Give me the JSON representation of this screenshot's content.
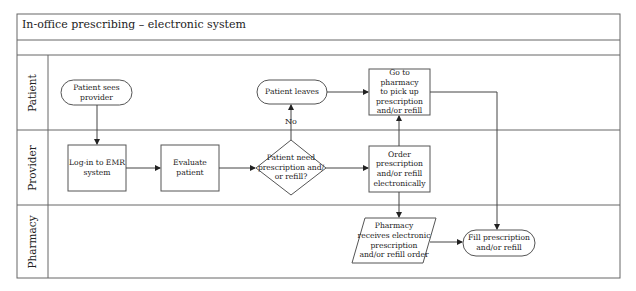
{
  "title": "In-office prescribing – electronic system",
  "lanes": [
    {
      "id": "patient",
      "label": "Patient"
    },
    {
      "id": "provider",
      "label": "Provider"
    },
    {
      "id": "pharmacy",
      "label": "Pharmacy"
    }
  ],
  "nodes": {
    "patient_sees_provider": {
      "shape": "terminator",
      "lane": "patient",
      "text": "Patient sees\nprovider"
    },
    "login_emr": {
      "shape": "process",
      "lane": "provider",
      "text": "Log-in to EMR\nsystem"
    },
    "evaluate_patient": {
      "shape": "process",
      "lane": "provider",
      "text": "Evaluate\npatient"
    },
    "decision_need": {
      "shape": "decision",
      "lane": "provider",
      "text": "Patient need\nprescription and/\nor refill?"
    },
    "patient_leaves": {
      "shape": "terminator",
      "lane": "patient",
      "text": "Patient leaves"
    },
    "go_to_pharmacy": {
      "shape": "process",
      "lane": "patient",
      "text": "Go to pharmacy\nto pick up\nprescription\nand/or refill"
    },
    "order_electronically": {
      "shape": "process",
      "lane": "provider",
      "text": "Order\nprescription\nand/or refill\nelectronically"
    },
    "pharmacy_receives": {
      "shape": "data",
      "lane": "pharmacy",
      "text": "Pharmacy\nreceives electronic\nprescription\nand/or refill order"
    },
    "fill_prescription": {
      "shape": "terminator",
      "lane": "pharmacy",
      "text": "Fill prescription\nand/or refill"
    }
  },
  "edges": [
    {
      "from": "patient_sees_provider",
      "to": "login_emr"
    },
    {
      "from": "login_emr",
      "to": "evaluate_patient"
    },
    {
      "from": "evaluate_patient",
      "to": "decision_need"
    },
    {
      "from": "decision_need",
      "to": "patient_leaves",
      "label": "No"
    },
    {
      "from": "decision_need",
      "to": "order_electronically"
    },
    {
      "from": "patient_leaves",
      "to": "go_to_pharmacy"
    },
    {
      "from": "order_electronically",
      "to": "go_to_pharmacy"
    },
    {
      "from": "order_electronically",
      "to": "pharmacy_receives"
    },
    {
      "from": "pharmacy_receives",
      "to": "fill_prescription"
    },
    {
      "from": "go_to_pharmacy",
      "to": "fill_prescription"
    }
  ],
  "edge_labels": {
    "no": "No"
  },
  "colors": {
    "line": "#555555",
    "text": "#222222",
    "background": "#ffffff"
  }
}
